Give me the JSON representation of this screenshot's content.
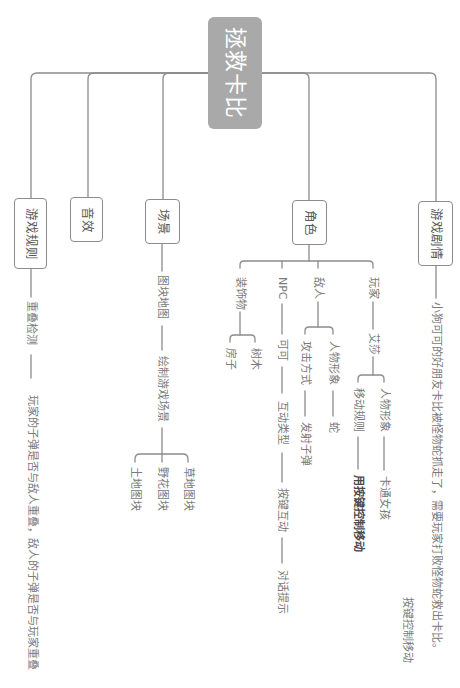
{
  "theme": {
    "root_bg": "#a9a9a9",
    "root_text": "#ffffff",
    "line": "#8c8c8c",
    "node_text": "#585858",
    "leaf_text": "#7a7a7a"
  },
  "mindmap": {
    "root": {
      "label": "拯救卡比"
    },
    "branches": [
      {
        "label": "游戏剧情",
        "children": [
          {
            "label": "小狗可可的好朋友卡比被怪物蛇抓走了，需要玩家打败怪物蛇救出卡比。",
            "note": "按键控制移动"
          }
        ]
      },
      {
        "label": "角色",
        "children": [
          {
            "label": "玩家",
            "children": [
              {
                "label": "艾莎",
                "children": [
                  {
                    "label": "人物形象",
                    "children": [
                      {
                        "label": "卡通女孩"
                      }
                    ]
                  },
                  {
                    "label": "移动规则",
                    "children": [
                      {
                        "label": "用按键控制移动"
                      }
                    ]
                  }
                ]
              }
            ]
          },
          {
            "label": "敌人",
            "children": [
              {
                "label": "人物形象",
                "children": [
                  {
                    "label": "蛇"
                  }
                ]
              },
              {
                "label": "攻击方式",
                "children": [
                  {
                    "label": "发射子弹"
                  }
                ]
              }
            ]
          },
          {
            "label": "NPC",
            "children": [
              {
                "label": "可可",
                "children": [
                  {
                    "label": "互动类型",
                    "children": [
                      {
                        "label": "按键互动",
                        "children": [
                          {
                            "label": "对话提示"
                          }
                        ]
                      }
                    ]
                  }
                ]
              }
            ]
          },
          {
            "label": "装饰物",
            "children": [
              {
                "label": "树木"
              },
              {
                "label": "房子"
              }
            ]
          }
        ]
      },
      {
        "label": "场景",
        "children": [
          {
            "label": "图块地图",
            "children": [
              {
                "label": "绘制游戏场景",
                "children": [
                  {
                    "label": "草地图块"
                  },
                  {
                    "label": "野花图块"
                  },
                  {
                    "label": "土地图块"
                  }
                ]
              }
            ]
          }
        ]
      },
      {
        "label": "音效"
      },
      {
        "label": "游戏规则",
        "children": [
          {
            "label": "重叠检测",
            "children": [
              {
                "label": "玩家的子弹是否与敌人重叠，敌人的子弹是否与玩家重叠"
              }
            ]
          }
        ]
      }
    ]
  }
}
